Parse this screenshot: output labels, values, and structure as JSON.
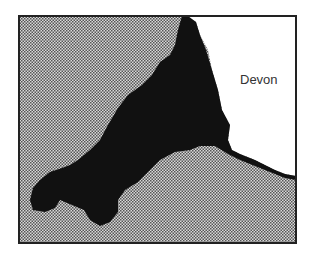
{
  "map": {
    "regions": [
      {
        "name": "Cornwall",
        "fill": "#111111",
        "style": "solid"
      },
      {
        "name": "Devon",
        "fill": "#ffffff",
        "style": "blank"
      },
      {
        "name": "Sea",
        "fill": "#9a9a9a",
        "style": "dotted-pattern"
      }
    ],
    "labels": {
      "devon": "Devon"
    },
    "frame_color": "#222222"
  }
}
